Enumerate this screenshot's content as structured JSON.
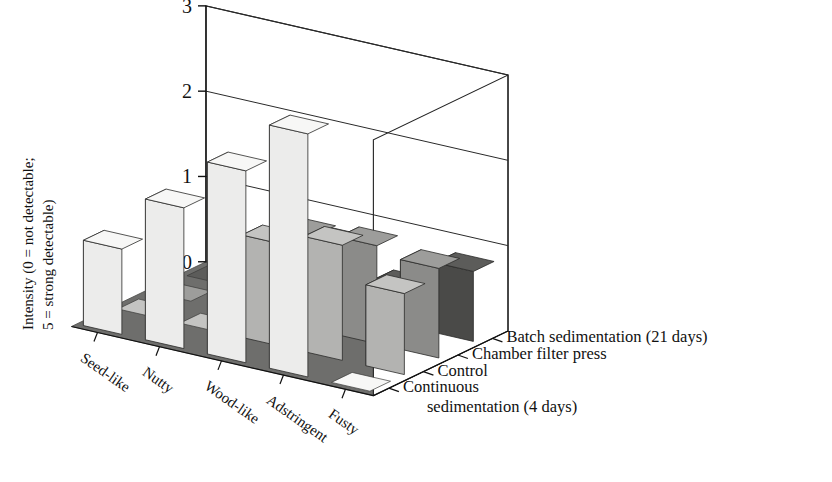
{
  "chart_data": {
    "type": "bar",
    "render": "3d-grouped-bar",
    "title": "",
    "xlabel": "",
    "ylabel": "Intensity (0 = not detectable; 5 = strong detectable)",
    "ylabel_lines": [
      "Intensity (0 = not detectable;",
      "5 = strong detectable)"
    ],
    "zlabel": "",
    "categories": [
      "Seed-like",
      "Nutty",
      "Wood-like",
      "Adstringent",
      "Fusty"
    ],
    "ylim": [
      0,
      3
    ],
    "yticks": [
      "0",
      "1",
      "2",
      "3"
    ],
    "ytick_values": [
      0,
      1,
      2,
      3
    ],
    "grid": true,
    "legend_position": "right-depth-axis",
    "series": [
      {
        "name": "Continuous sedimentation (4 days)",
        "name_lines": [
          "Continuous",
          "sedimentation (4 days)"
        ],
        "color": "#ececeb",
        "top_color": "#f7f7f6",
        "side_color": "#d8d8d6",
        "values": [
          1.0,
          1.65,
          2.25,
          2.85,
          0.0
        ]
      },
      {
        "name": "Control",
        "name_lines": [
          "Control"
        ],
        "color": "#b3b3b1",
        "top_color": "#c4c4c2",
        "side_color": "#9b9b99",
        "values": [
          0.0,
          0.0,
          1.2,
          1.35,
          0.95
        ]
      },
      {
        "name": "Chamber filter press",
        "name_lines": [
          "Chamber filter press"
        ],
        "color": "#8b8b89",
        "top_color": "#9d9d9b",
        "side_color": "#747472",
        "values": [
          0.0,
          0.0,
          1.1,
          1.15,
          1.05
        ]
      },
      {
        "name": "Batch sedimentation (21 days)",
        "name_lines": [
          "Batch sedimentation (21 days)"
        ],
        "color": "#4a4a48",
        "top_color": "#5c5c5a",
        "side_color": "#3a3a38",
        "values": [
          0.0,
          0.0,
          0.78,
          0.45,
          0.82
        ]
      }
    ],
    "floor_color": "#6e6e6c",
    "wall_color": "#ffffff",
    "axis_color": "#222222"
  }
}
